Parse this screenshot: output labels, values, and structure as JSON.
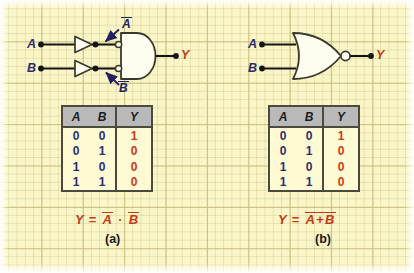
{
  "figure": {
    "background": "#fbf6c8",
    "grid_color": "#c4ba78"
  },
  "colors": {
    "input_label": "#2b2d6e",
    "output_label": "#c43a17",
    "equation": "#c43a17",
    "annotation": "#21215e",
    "wire": "#141414",
    "gate_fill": "#fffdf0",
    "gate_stroke": "#3a3a2c",
    "table_header_bg": "#b9b9b9",
    "table_border": "#4c4a3c",
    "table_value_0_1": "#2b2d6e",
    "table_value_y": "#cf3a12"
  },
  "panel_a": {
    "caption": "(a)",
    "equation": {
      "lhs": "Y",
      "eq": "=",
      "term1": "A",
      "op": "·",
      "term2": "B"
    },
    "circuit": {
      "inputs": [
        {
          "label": "A",
          "name": "input-a"
        },
        {
          "label": "B",
          "name": "input-b"
        }
      ],
      "output": {
        "label": "Y",
        "name": "output-y"
      },
      "gates": [
        {
          "type": "inverter",
          "name": "inverter-a"
        },
        {
          "type": "inverter",
          "name": "inverter-b"
        },
        {
          "type": "and-with-inverted-inputs",
          "name": "and-gate"
        }
      ],
      "annotations": [
        {
          "label": "A",
          "overbar": true,
          "name": "annotation-not-a"
        },
        {
          "label": "B",
          "overbar": true,
          "name": "annotation-not-b"
        }
      ]
    },
    "table": {
      "headers": [
        "A",
        "B",
        "Y"
      ],
      "rows": [
        [
          "0",
          "0",
          "1"
        ],
        [
          "0",
          "1",
          "0"
        ],
        [
          "1",
          "0",
          "0"
        ],
        [
          "1",
          "1",
          "0"
        ]
      ]
    }
  },
  "panel_b": {
    "caption": "(b)",
    "equation": {
      "lhs": "Y",
      "eq": "=",
      "term1": "A",
      "op": "+",
      "term2": "B"
    },
    "circuit": {
      "inputs": [
        {
          "label": "A",
          "name": "input-a"
        },
        {
          "label": "B",
          "name": "input-b"
        }
      ],
      "output": {
        "label": "Y",
        "name": "output-y"
      },
      "gates": [
        {
          "type": "nor",
          "name": "nor-gate"
        }
      ]
    },
    "table": {
      "headers": [
        "A",
        "B",
        "Y"
      ],
      "rows": [
        [
          "0",
          "0",
          "1"
        ],
        [
          "0",
          "1",
          "0"
        ],
        [
          "1",
          "0",
          "0"
        ],
        [
          "1",
          "1",
          "0"
        ]
      ]
    }
  }
}
